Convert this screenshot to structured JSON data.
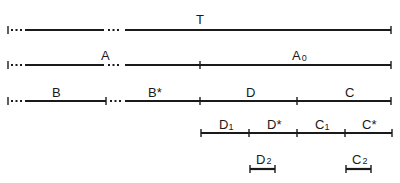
{
  "diagram": {
    "rows": [
      {
        "id": "T",
        "labels": [
          {
            "text": "T",
            "x": 200,
            "y": 24
          }
        ],
        "y": 30
      },
      {
        "id": "A",
        "labels": [
          {
            "text": "A",
            "x": 105,
            "y": 60
          },
          {
            "text": "A",
            "sub": "0",
            "x": 296,
            "y": 60
          }
        ],
        "y": 65
      },
      {
        "id": "B-D-C",
        "labels": [
          {
            "text": "B",
            "x": 57,
            "y": 97
          },
          {
            "text": "B*",
            "x": 155,
            "y": 97
          },
          {
            "text": "D",
            "x": 250,
            "y": 97
          },
          {
            "text": "C",
            "x": 349,
            "y": 97
          }
        ],
        "y": 101
      },
      {
        "id": "D-C-split",
        "labels": [
          {
            "text": "D",
            "sub": "1",
            "x": 225,
            "y": 129
          },
          {
            "text": "D*",
            "x": 272,
            "y": 129
          },
          {
            "text": "C",
            "sub": "1",
            "x": 321,
            "y": 129
          },
          {
            "text": "C*",
            "x": 369,
            "y": 129
          }
        ],
        "y": 133
      },
      {
        "id": "D2-C2",
        "labels": [
          {
            "text": "D",
            "sub": "2",
            "x": 262,
            "y": 164
          },
          {
            "text": "C",
            "sub": "2",
            "x": 358,
            "y": 164
          }
        ],
        "y": 169
      }
    ],
    "labels_text": {
      "t": "T",
      "a": "A",
      "a0_main": "A",
      "a0_sub": "0",
      "b": "B",
      "b_star": "B*",
      "d": "D",
      "c": "C",
      "d1_main": "D",
      "d1_sub": "1",
      "d_star": "D*",
      "c1_main": "C",
      "c1_sub": "1",
      "c_star": "C*",
      "d2_main": "D",
      "d2_sub": "2",
      "c2_main": "C",
      "c2_sub": "2"
    },
    "colors": {
      "ink": "#1a1a1a",
      "background": "#ffffff"
    }
  }
}
